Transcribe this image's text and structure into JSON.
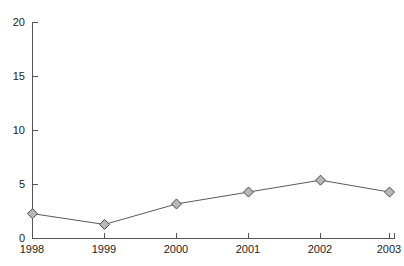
{
  "chart_data": {
    "type": "line",
    "title": "",
    "subtitle": "",
    "xlabel": "",
    "ylabel": "",
    "categories": [
      "1998",
      "1999",
      "2000",
      "2001",
      "2002",
      "2003"
    ],
    "values": [
      2.3,
      1.3,
      3.2,
      4.3,
      5.4,
      4.3
    ],
    "series": [
      {
        "name": "",
        "values": [
          2.3,
          1.3,
          3.2,
          4.3,
          5.4,
          4.3
        ]
      }
    ],
    "x": [
      "1998",
      "1999",
      "2000",
      "2001",
      "2002",
      "2003"
    ],
    "ylim": [
      0,
      20
    ],
    "yticks": [
      0,
      5,
      10,
      15,
      20
    ],
    "ytick_labels": [
      "0",
      "5",
      "10",
      "15",
      "20"
    ],
    "xtick_labels": [
      "1998",
      "1999",
      "2000",
      "2001",
      "2002",
      "2003"
    ],
    "grid": false,
    "legend": false,
    "legend_position": "none",
    "marker": "diamond",
    "marker_fill": "#b8b8b8",
    "marker_stroke": "#4a4a4a",
    "line_color": "#5a5a5a",
    "axis_color": "#555555",
    "background": "#ffffff",
    "annotations": []
  },
  "axes": {
    "y_axis_name": "value-axis",
    "x_axis_name": "year-axis"
  }
}
